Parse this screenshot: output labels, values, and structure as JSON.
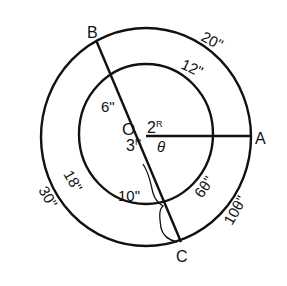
{
  "diagram": {
    "title": "",
    "points": {
      "O": {
        "label": "O"
      },
      "A": {
        "label": "A"
      },
      "B": {
        "label": "B"
      },
      "C": {
        "label": "C"
      }
    },
    "arcs": {
      "outer_top": "20\"",
      "inner_top": "12\"",
      "inner_left": "18\"",
      "outer_left": "30\"",
      "inner_right": "6θ\"",
      "outer_right": "10θ\""
    },
    "radii": {
      "inner_radius": "6\"",
      "inner_to_outer": "10\""
    },
    "angles": {
      "AOB": "2ᴿ",
      "BOC": "3ᴿ",
      "AOC": "θ"
    },
    "angle_labels": {
      "two": "2",
      "three": "3",
      "R": "R",
      "theta": "θ"
    },
    "colors": {
      "stroke": "#111111",
      "background": "#ffffff"
    }
  }
}
